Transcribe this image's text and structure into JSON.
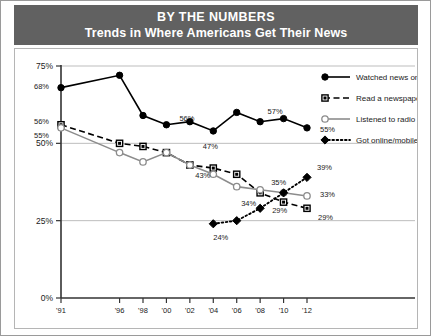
{
  "header": {
    "title": "BY THE NUMBERS",
    "subtitle": "Trends in Where Americans Get Their News"
  },
  "chart_data": {
    "type": "line",
    "title": "BY THE NUMBERS",
    "subtitle": "Trends in Where Americans Get Their News",
    "xlabel": "",
    "ylabel": "",
    "ylim": [
      0,
      75
    ],
    "ytick_labels": [
      "0%",
      "25%",
      "50%",
      "75%"
    ],
    "ytick_values": [
      0,
      25,
      50,
      75
    ],
    "grid": true,
    "legend_position": "top-right",
    "x": [
      1991,
      1996,
      1998,
      2000,
      2002,
      2004,
      2006,
      2008,
      2010,
      2012
    ],
    "xtick_labels": [
      "'91",
      "'96",
      "'98",
      "'00",
      "'02",
      "'04",
      "'06",
      "'08",
      "'10",
      "'12"
    ],
    "series": [
      {
        "name": "Watched news on TV",
        "marker": "filled-circle",
        "line": "solid",
        "color": "#000000",
        "values": [
          68,
          72,
          59,
          56,
          57,
          54,
          60,
          57,
          58,
          55
        ],
        "point_labels": {
          "1991": "68%",
          "2000": "56%",
          "2010": "57%",
          "2012": "55%"
        }
      },
      {
        "name": "Read a newspaper",
        "marker": "filled-square",
        "line": "dashed",
        "color": "#000000",
        "values": [
          56,
          50,
          49,
          47,
          43,
          42,
          40,
          34,
          31,
          29
        ],
        "point_labels": {
          "1991": "56%",
          "2002": "47%",
          "2008": "34%",
          "2012": "29%"
        }
      },
      {
        "name": "Listened to radio news",
        "marker": "open-circle",
        "line": "solid",
        "color": "#8c8c8c",
        "values": [
          55,
          47,
          44,
          47,
          43,
          40,
          36,
          35,
          34,
          33
        ],
        "point_labels": {
          "1991": "55%",
          "2004": "43%",
          "2008": "35%",
          "2012": "33%"
        }
      },
      {
        "name": "Got online/mobile news",
        "marker": "filled-diamond",
        "line": "dotted",
        "color": "#000000",
        "values": [
          null,
          null,
          null,
          null,
          null,
          24,
          25,
          29,
          34,
          39
        ],
        "point_labels": {
          "2004": "24%",
          "2008": "29%",
          "2010": "34%",
          "2012": "39%"
        }
      }
    ],
    "annotations": [
      {
        "text": "68%",
        "x": 1991,
        "y": 68
      },
      {
        "text": "56%",
        "x": 1991,
        "y": 56
      },
      {
        "text": "55%",
        "x": 1991,
        "y": 55
      },
      {
        "text": "56%",
        "x": 2000,
        "y": 56
      },
      {
        "text": "47%",
        "x": 2002,
        "y": 47
      },
      {
        "text": "43%",
        "x": 2004,
        "y": 43
      },
      {
        "text": "24%",
        "x": 2004,
        "y": 24
      },
      {
        "text": "29%",
        "x": 2008,
        "y": 29
      },
      {
        "text": "35%",
        "x": 2008,
        "y": 35
      },
      {
        "text": "34%",
        "x": 2008,
        "y": 34
      },
      {
        "text": "57%",
        "x": 2010,
        "y": 57
      },
      {
        "text": "55%",
        "x": 2012,
        "y": 55
      },
      {
        "text": "39%",
        "x": 2012,
        "y": 39
      },
      {
        "text": "33%",
        "x": 2012,
        "y": 33
      },
      {
        "text": "29%",
        "x": 2012,
        "y": 29
      }
    ]
  },
  "legend": {
    "items": [
      {
        "label": "Watched news on TV"
      },
      {
        "label": "Read a newspaper"
      },
      {
        "label": "Listened to radio news"
      },
      {
        "label": "Got online/mobile news"
      }
    ]
  },
  "colors": {
    "header_bg": "#616161",
    "header_text": "#ffffff",
    "axis": "#333333",
    "grid": "#bdbdbd",
    "series_dark": "#000000",
    "series_gray": "#8c8c8c"
  }
}
